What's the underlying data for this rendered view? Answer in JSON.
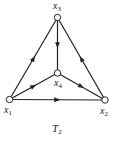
{
  "title": "T2",
  "title_main": "T",
  "title_sub": "2",
  "nodes": [
    {
      "id": "x1",
      "main": "x",
      "sub": "1",
      "cx": 9.5,
      "cy": 99.5
    },
    {
      "id": "x2",
      "main": "x",
      "sub": "2",
      "cx": 105,
      "cy": 100
    },
    {
      "id": "x3",
      "main": "x",
      "sub": "3",
      "cx": 57.5,
      "cy": 17.5
    },
    {
      "id": "x4",
      "main": "x",
      "sub": "4",
      "cx": 57.5,
      "cy": 73
    }
  ],
  "edges": [
    {
      "from": "x1",
      "to": "x3"
    },
    {
      "from": "x3",
      "to": "x4"
    },
    {
      "from": "x2",
      "to": "x3"
    },
    {
      "from": "x1",
      "to": "x4"
    },
    {
      "from": "x4",
      "to": "x2"
    },
    {
      "from": "x1",
      "to": "x2"
    }
  ],
  "colors": {
    "line": "#222222",
    "node_fill": "#ffffff"
  }
}
